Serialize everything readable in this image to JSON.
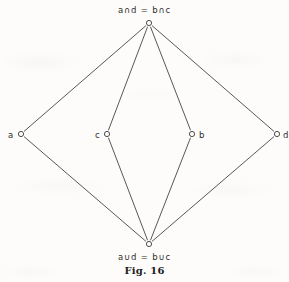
{
  "figure": {
    "caption": "Fig. 16",
    "type": "hasse-diagram",
    "top_label": "a∩d = b∩c",
    "bottom_label": "a∪d = b∪c",
    "background_color": "#fdfcfa",
    "line_color": "#3a3a3a"
  },
  "nodes": [
    {
      "id": "top",
      "label": "a∩d = b∩c",
      "x": 149,
      "y": 23,
      "label_x": 149,
      "label_y": 5,
      "label_align": "center"
    },
    {
      "id": "a",
      "label": "a",
      "x": 21,
      "y": 134,
      "label_x": 8,
      "label_y": 130,
      "label_align": "left"
    },
    {
      "id": "c",
      "label": "c",
      "x": 107,
      "y": 134,
      "label_x": 95,
      "label_y": 130,
      "label_align": "left"
    },
    {
      "id": "b",
      "label": "b",
      "x": 192,
      "y": 134,
      "label_x": 199,
      "label_y": 130,
      "label_align": "left"
    },
    {
      "id": "d",
      "label": "d",
      "x": 277,
      "y": 134,
      "label_x": 283,
      "label_y": 130,
      "label_align": "left"
    },
    {
      "id": "bottom",
      "label": "a∪d = b∪c",
      "x": 149,
      "y": 244,
      "label_x": 149,
      "label_y": 252,
      "label_align": "center"
    }
  ],
  "edges": [
    {
      "from": "top",
      "to": "a"
    },
    {
      "from": "top",
      "to": "c"
    },
    {
      "from": "top",
      "to": "b"
    },
    {
      "from": "top",
      "to": "d"
    },
    {
      "from": "a",
      "to": "bottom"
    },
    {
      "from": "c",
      "to": "bottom"
    },
    {
      "from": "b",
      "to": "bottom"
    },
    {
      "from": "d",
      "to": "bottom"
    }
  ],
  "node_radius": 2.6,
  "labels": {
    "top": "a∩d = b∩c",
    "a": "a",
    "b": "b",
    "c": "c",
    "d": "d",
    "bottom": "a∪d = b∪c",
    "caption": "Fig. 16"
  }
}
